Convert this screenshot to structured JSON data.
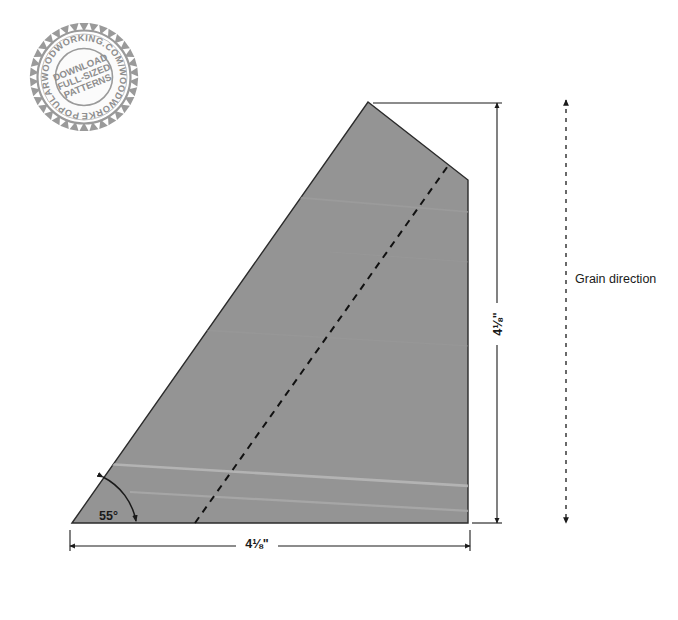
{
  "diagram": {
    "shape": {
      "name": "workpiece-wedge",
      "fill_color": "#949494",
      "stroke_color": "#2b2b2b",
      "vertices": [
        [
          72,
          523
        ],
        [
          368,
          102
        ],
        [
          468,
          180
        ],
        [
          468,
          523
        ]
      ]
    },
    "layout_line": {
      "name": "dashed-layout-line",
      "from": [
        195,
        523
      ],
      "to": [
        450,
        163
      ],
      "style": "dashed",
      "color": "#111111"
    },
    "grain_streaks": [
      {
        "from": [
          110,
          466
        ],
        "to": [
          468,
          486
        ],
        "color": "#b4b4b4"
      },
      {
        "from": [
          150,
          495
        ],
        "to": [
          468,
          512
        ],
        "color": "#a8a8a8"
      },
      {
        "from": [
          300,
          200
        ],
        "to": [
          468,
          214
        ],
        "color": "#9c9c9c"
      }
    ]
  },
  "dimensions": {
    "width": {
      "label": "4⅛\"",
      "value": 4.125,
      "unit": "inch",
      "orientation": "horizontal",
      "from_x": 70,
      "to_x": 470,
      "line_y": 546
    },
    "height": {
      "label": "4⅛\"",
      "value": 4.125,
      "unit": "inch",
      "orientation": "vertical",
      "from_y": 103,
      "to_y": 523,
      "line_x": 497
    },
    "angle": {
      "label": "55°",
      "value": 55,
      "unit": "degree"
    }
  },
  "grain": {
    "label": "Grain direction",
    "arrow": {
      "line_x": 566,
      "from_y": 100,
      "to_y": 523,
      "style": "dashed",
      "double_headed": true
    },
    "label_x": 575,
    "label_y": 283
  },
  "stamp": {
    "name": "download-patterns-stamp",
    "outer_text": "POPULARWOODWORKING.COM/WOODWORKERSKITCHEN",
    "inner_lines": [
      "DOWNLOAD",
      "FULL-SIZED",
      "PATTERNS"
    ],
    "center_x": 84,
    "center_y": 77,
    "radius": 54,
    "color": "#8e8e8e",
    "teeth": 34
  }
}
